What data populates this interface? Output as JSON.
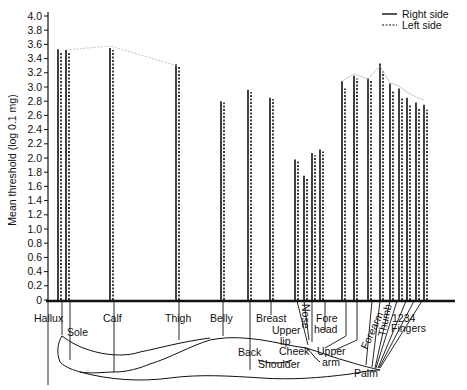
{
  "chart_data": {
    "type": "bar",
    "title": "",
    "xlabel": "",
    "ylabel": "Mean threshold (log 0.1 mg)",
    "ylim": [
      0,
      4.0
    ],
    "yticks": [
      "0",
      "0.2",
      "0.4",
      "0.6",
      "0.8",
      "1.0",
      "1.2",
      "1.4",
      "1.6",
      "1.8",
      "2.0",
      "2.2",
      "2.4",
      "2.6",
      "2.8",
      "3.0",
      "3.2",
      "3.4",
      "3.6",
      "3.8",
      "4.0"
    ],
    "grid": false,
    "legend_position": "top-right",
    "categories": [
      "Hallux",
      "Sole",
      "Calf",
      "Thigh",
      "Belly",
      "Back",
      "Breast",
      "Nose",
      "Upper lip",
      "Cheek",
      "Forehead",
      "Upper arm",
      "Shoulder",
      "Forearm",
      "Palm",
      "Thumb",
      "Finger 1",
      "Finger 2",
      "Finger 3",
      "Finger 4"
    ],
    "series": [
      {
        "name": "Right side",
        "style": "solid",
        "values": [
          3.53,
          3.52,
          3.55,
          3.32,
          2.8,
          2.96,
          2.85,
          1.98,
          1.75,
          2.07,
          2.12,
          3.08,
          3.16,
          3.12,
          3.33,
          3.05,
          2.98,
          2.85,
          2.78,
          2.75
        ]
      },
      {
        "name": "Left side",
        "style": "dashed",
        "values": [
          3.5,
          3.5,
          3.52,
          3.3,
          2.78,
          2.93,
          2.83,
          1.95,
          1.72,
          2.04,
          2.09,
          2.98,
          3.12,
          3.1,
          3.22,
          2.95,
          2.85,
          2.75,
          2.7,
          2.68
        ]
      }
    ],
    "annotations": [
      "Hallux",
      "Sole",
      "Calf",
      "Thigh",
      "Belly",
      "Breast",
      "Back",
      "Upper lip",
      "Nose",
      "Fore head",
      "Cheek",
      "Upper arm",
      "Shoulder",
      "Forearm",
      "Palm",
      "Thumb",
      "1234",
      "Fingers"
    ]
  },
  "labels": {
    "ylabel": "Mean threshold (log 0.1 mg)",
    "legend_right": "Right side",
    "legend_left": "Left side",
    "hallux": "Hallux",
    "sole": "Sole",
    "calf": "Calf",
    "thigh": "Thigh",
    "belly": "Belly",
    "breast": "Breast",
    "back": "Back",
    "upper_lip_1": "Upper",
    "upper_lip_2": "lip",
    "nose": "Nose",
    "fore_1": "Fore",
    "fore_2": "head",
    "cheek": "Cheek",
    "upper_arm_1": "Upper",
    "upper_arm_2": "arm",
    "shoulder": "Shoulder",
    "forearm": "Forearm",
    "palm": "Palm",
    "thumb": "Thumb",
    "finger_nums": "1234",
    "fingers": "Fingers"
  }
}
